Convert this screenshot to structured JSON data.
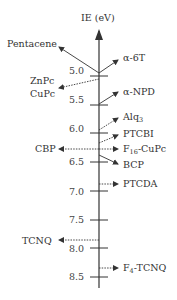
{
  "diagram": {
    "title": "IE (eV)",
    "axis": {
      "label": "IE (eV)",
      "direction": "decreasing upward",
      "ticks": [
        "5.0",
        "5.5",
        "6.0",
        "6.5",
        "7.0",
        "7.5",
        "8.0",
        "8.5"
      ]
    },
    "materials": [
      {
        "name": "Pentacene",
        "side": "left",
        "style": "solid",
        "ie": 4.95
      },
      {
        "name": "α-6T",
        "side": "right",
        "style": "solid",
        "ie": 4.95
      },
      {
        "name": "ZnPc",
        "side": "left",
        "style": "dotted",
        "ie": 5.05
      },
      {
        "name": "CuPc",
        "side": "left",
        "style": "dotted",
        "ie": 5.05
      },
      {
        "name": "α-NPD",
        "side": "right",
        "style": "solid",
        "ie": 5.5
      },
      {
        "name": "Alq",
        "sub": "3",
        "side": "right",
        "style": "dotted",
        "ie": 5.95
      },
      {
        "name": "PTCBI",
        "side": "right",
        "style": "dotted",
        "ie": 6.15
      },
      {
        "name": "CBP",
        "side": "left",
        "style": "dotted",
        "ie": 6.3
      },
      {
        "name": "F",
        "sub": "16",
        "suffix": "-CuPc",
        "side": "right",
        "style": "dotted",
        "ie": 6.3
      },
      {
        "name": "BCP",
        "side": "right",
        "style": "solid",
        "ie": 6.4
      },
      {
        "name": "PTCDA",
        "side": "right",
        "style": "dotted",
        "ie": 6.9
      },
      {
        "name": "TCNQ",
        "side": "left",
        "style": "dotted",
        "ie": 7.9
      },
      {
        "name": "F",
        "sub": "4",
        "suffix": "-TCNQ",
        "side": "right",
        "style": "dotted",
        "ie": 8.35
      }
    ]
  }
}
